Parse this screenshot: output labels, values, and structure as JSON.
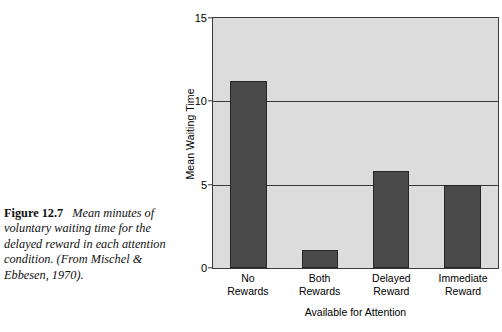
{
  "caption": {
    "figure_label": "Figure 12.7",
    "text": "Mean minutes of voluntary waiting time for the delayed reward in each attention condition. (From Mischel & Ebbesen, 1970)."
  },
  "colors": {
    "bar_fill": "#4a4a4a",
    "bar_outline": "#262626",
    "plot_background": "#dcdcdc",
    "axis_line": "#3a3a3a",
    "page_background": "#ffffff",
    "text": "#000000"
  },
  "chart_data": {
    "type": "bar",
    "title": "",
    "xlabel": "Available for Attention",
    "ylabel": "Mean Waiting Time",
    "categories": [
      "No\nRewards",
      "Both\nRewards",
      "Delayed\nReward",
      "Immediate\nReward"
    ],
    "category_lines": [
      [
        "No",
        "Rewards"
      ],
      [
        "Both",
        "Rewards"
      ],
      [
        "Delayed",
        "Reward"
      ],
      [
        "Immediate",
        "Reward"
      ]
    ],
    "values": [
      11.2,
      1.1,
      5.85,
      5.0
    ],
    "ylim": [
      0,
      15
    ],
    "yticks": [
      0,
      5,
      10,
      15
    ],
    "ytick_labels": [
      "0",
      "5",
      "10",
      "15"
    ],
    "grid": true,
    "legend": false
  }
}
